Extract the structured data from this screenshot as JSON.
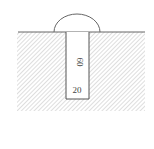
{
  "diagram": {
    "type": "cross-section",
    "labels": {
      "depth": "60",
      "width": "20"
    },
    "colors": {
      "line": "#666666",
      "hatch": "#bbbbbb",
      "background": "#ffffff"
    }
  }
}
